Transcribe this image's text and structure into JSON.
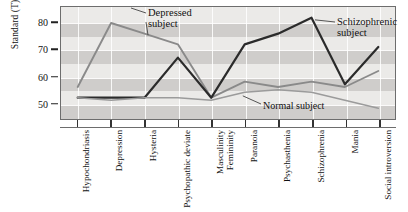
{
  "chart_data": {
    "type": "line",
    "title": "",
    "xlabel": "",
    "ylabel": "Standard (T) score",
    "ylim": [
      44,
      86
    ],
    "yticks": [
      50,
      60,
      70,
      80
    ],
    "grid": true,
    "legend_position": "inline-annotations",
    "categories": [
      "Hypochondriasis",
      "Depression",
      "Hysteria",
      "Psychopathic deviate",
      "Masculinity Femininity",
      "Paranoia",
      "Psychasthenia",
      "Schizophrenia",
      "Mania",
      "Social introversion"
    ],
    "series": [
      {
        "name": "Depressed subject",
        "color": "#8a8a8a",
        "values": [
          56,
          80,
          76,
          72,
          52,
          58,
          56,
          58,
          56,
          62
        ]
      },
      {
        "name": "Schizophrenic subject",
        "color": "#2b2b2b",
        "values": [
          52,
          52,
          52,
          67,
          52,
          72,
          76,
          82,
          57,
          71
        ]
      },
      {
        "name": "Normal subject",
        "color": "#9b9b9b",
        "values": [
          52,
          51,
          52,
          52,
          51,
          54,
          55,
          54,
          51,
          48
        ]
      }
    ],
    "annotations": [
      {
        "id": "depressed",
        "text": "Depressed\nsubject"
      },
      {
        "id": "schizophrenic",
        "text": "Schizophrenic\nsubject"
      },
      {
        "id": "normal",
        "text": "Normal subject"
      }
    ]
  },
  "axis": {
    "y_title": "Standard (T) score",
    "y_tick_labels": [
      "80",
      "70",
      "60",
      "50"
    ]
  },
  "colors": {
    "plot_background": "#f2f1ef",
    "band_dark": "#c9c7c4",
    "band_light": "#e6e4e1",
    "frame": "#6d6d6d",
    "depressed": "#8a8a8a",
    "schizophrenic": "#2b2b2b",
    "normal": "#9b9b9b",
    "text": "#111111"
  }
}
